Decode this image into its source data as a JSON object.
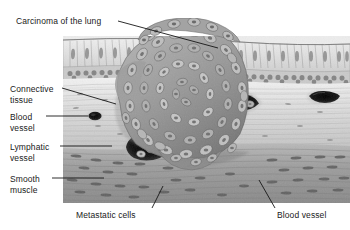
{
  "figure": {
    "panel": {
      "x": 63,
      "y": 36,
      "width": 287,
      "height": 167
    }
  },
  "labels": [
    {
      "id": "carcinoma",
      "text": "Carcinoma of the lung",
      "x": 16,
      "y": 16,
      "align": "left"
    },
    {
      "id": "connective",
      "text": "Connective\ntissue",
      "x": 10,
      "y": 84,
      "align": "left"
    },
    {
      "id": "blood-vessel-1",
      "text": "Blood\nvessel",
      "x": 10,
      "y": 112,
      "align": "left"
    },
    {
      "id": "lymphatic",
      "text": "Lymphatic\nvessel",
      "x": 10,
      "y": 142,
      "align": "left"
    },
    {
      "id": "smooth-muscle",
      "text": "Smooth\nmuscle",
      "x": 10,
      "y": 174,
      "align": "left"
    },
    {
      "id": "metastatic",
      "text": "Metastatic cells",
      "x": 76,
      "y": 210,
      "align": "left"
    },
    {
      "id": "blood-vessel-2",
      "text": "Blood vessel",
      "x": 277,
      "y": 210,
      "align": "left"
    }
  ],
  "leaders": [
    {
      "id": "leader-carcinoma",
      "x1": 118,
      "y1": 21,
      "x2": 218,
      "y2": 48
    },
    {
      "id": "leader-connective",
      "x1": 62,
      "y1": 88,
      "x2": 116,
      "y2": 104
    },
    {
      "id": "leader-blood-vessel-1",
      "x1": 46,
      "y1": 116,
      "x2": 88,
      "y2": 116
    },
    {
      "id": "leader-lymphatic",
      "x1": 60,
      "y1": 146,
      "x2": 112,
      "y2": 146
    },
    {
      "id": "leader-smooth-muscle",
      "x1": 52,
      "y1": 178,
      "x2": 104,
      "y2": 178
    },
    {
      "id": "leader-metastatic",
      "x1": 152,
      "y1": 208,
      "x2": 163,
      "y2": 186
    },
    {
      "id": "leader-blood-vessel-2",
      "x1": 275,
      "y1": 208,
      "x2": 259,
      "y2": 180
    }
  ],
  "structures": [
    {
      "id": "epithelium",
      "name": "columnar epithelium"
    },
    {
      "id": "basal-layer",
      "name": "basal cell layer"
    },
    {
      "id": "connective-tissue",
      "name": "connective tissue"
    },
    {
      "id": "smooth-muscle",
      "name": "smooth muscle layer"
    },
    {
      "id": "tumor-mass",
      "name": "carcinoma cell mass"
    },
    {
      "id": "blood-vessel-left",
      "name": "blood vessel lumen"
    },
    {
      "id": "lymphatic-vessel",
      "name": "lymphatic vessel lumen"
    },
    {
      "id": "blood-vessel-upper",
      "name": "blood vessel lumen"
    },
    {
      "id": "blood-vessel-right",
      "name": "blood vessel lumen"
    }
  ],
  "colors": {
    "background": "#ffffff",
    "label_text": "#1a1a1a",
    "leader_line": "#161616",
    "lumen_dark": "#0d0d0d",
    "tissue_light": "#dedede",
    "tissue_mid": "#a8a8a8",
    "tissue_dark": "#6e6e6e"
  }
}
